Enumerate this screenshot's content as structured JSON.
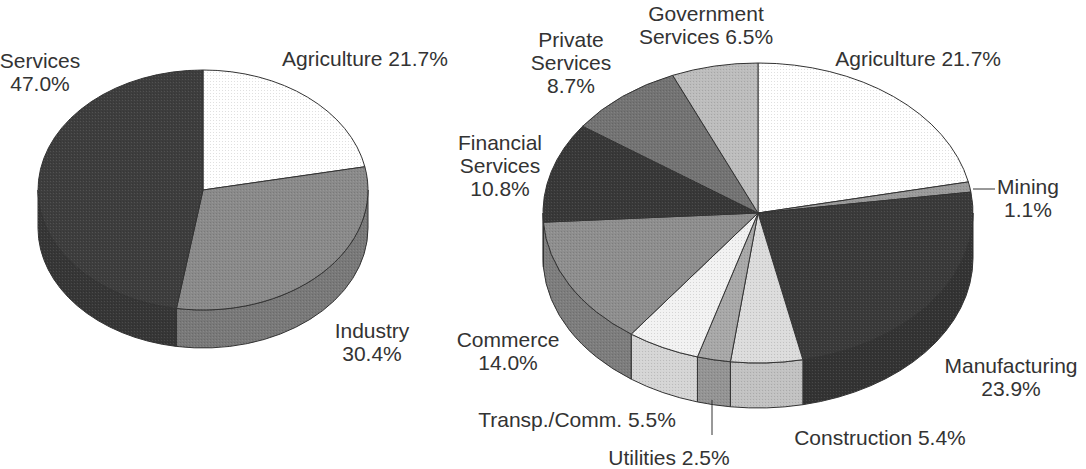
{
  "chart_data": [
    {
      "type": "pie",
      "style": "3d-tilted",
      "title": "",
      "start": "top",
      "direction": "clockwise",
      "slices": [
        {
          "label": "Agriculture",
          "value": 21.7,
          "display": "Agriculture 21.7%",
          "color": "#ffffff"
        },
        {
          "label": "Industry",
          "value": 30.4,
          "display": "Industry\n30.4%",
          "color": "#8a8a8a"
        },
        {
          "label": "Services",
          "value": 47.0,
          "display": "Services\n47.0%",
          "color": "#3d3d3d"
        }
      ]
    },
    {
      "type": "pie",
      "style": "3d-tilted",
      "title": "",
      "start": "top",
      "direction": "clockwise",
      "slices": [
        {
          "label": "Agriculture",
          "value": 21.7,
          "display": "Agriculture 21.7%",
          "color": "#ffffff"
        },
        {
          "label": "Mining",
          "value": 1.1,
          "display": "Mining\n1.1%",
          "color": "#9a9a9a"
        },
        {
          "label": "Manufacturing",
          "value": 23.9,
          "display": "Manufacturing\n23.9%",
          "color": "#3a3a3a"
        },
        {
          "label": "Construction",
          "value": 5.4,
          "display": "Construction 5.4%",
          "color": "#dcdcdc"
        },
        {
          "label": "Utilities",
          "value": 2.5,
          "display": "Utilities 2.5%",
          "color": "#a8a8a8"
        },
        {
          "label": "Transp./Comm.",
          "value": 5.5,
          "display": "Transp./Comm. 5.5%",
          "color": "#f2f2f2"
        },
        {
          "label": "Commerce",
          "value": 14.0,
          "display": "Commerce\n14.0%",
          "color": "#8e8e8e"
        },
        {
          "label": "Financial Services",
          "value": 10.8,
          "display": "Financial\nServices\n10.8%",
          "color": "#383838"
        },
        {
          "label": "Private Services",
          "value": 8.7,
          "display": "Private\nServices\n8.7%",
          "color": "#737373"
        },
        {
          "label": "Government Services",
          "value": 6.5,
          "display": "Government\nServices 6.5%",
          "color": "#bdbdbd"
        }
      ]
    }
  ]
}
